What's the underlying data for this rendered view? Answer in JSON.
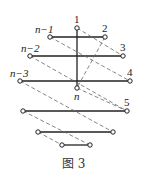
{
  "figure": {
    "caption": "图 3",
    "labels": {
      "top": "1",
      "r1_left": "n−1",
      "r1_right": "2",
      "r2_left": "n−2",
      "r2_right": "3",
      "r3_left": "n−3",
      "r3_right": "4",
      "center_bottom": "n",
      "r4_right": "5"
    },
    "nodes": [
      {
        "id": "1",
        "x": 77,
        "y": 28
      },
      {
        "id": "n-1",
        "x": 50,
        "y": 37
      },
      {
        "id": "2",
        "x": 105,
        "y": 37
      },
      {
        "id": "n-2",
        "x": 30,
        "y": 56
      },
      {
        "id": "3",
        "x": 123,
        "y": 56
      },
      {
        "id": "n-3",
        "x": 20,
        "y": 81
      },
      {
        "id": "4",
        "x": 130,
        "y": 81
      },
      {
        "id": "n",
        "x": 77,
        "y": 88
      },
      {
        "id": "r4-left",
        "x": 23,
        "y": 111
      },
      {
        "id": "5",
        "x": 127,
        "y": 111
      },
      {
        "id": "r5-left",
        "x": 38,
        "y": 132
      },
      {
        "id": "r5-right",
        "x": 113,
        "y": 132
      },
      {
        "id": "r6-left",
        "x": 62,
        "y": 145
      },
      {
        "id": "r6-right",
        "x": 90,
        "y": 145
      }
    ],
    "solid_edges": [
      [
        "1",
        "n"
      ],
      [
        "n-1",
        "2"
      ],
      [
        "n-2",
        "3"
      ],
      [
        "n-3",
        "4"
      ],
      [
        "r4-left",
        "5"
      ],
      [
        "r5-left",
        "r5-right"
      ],
      [
        "r6-left",
        "r6-right"
      ]
    ],
    "dashed_edges": [
      [
        "1",
        "3"
      ],
      [
        "n-1",
        "4"
      ],
      [
        "2",
        "n"
      ],
      [
        "n-2",
        "5"
      ],
      [
        "n",
        "5"
      ],
      [
        "n-3",
        "r5-right"
      ],
      [
        "r4-left",
        "r6-right"
      ],
      [
        "r5-left",
        "r6-left"
      ]
    ]
  }
}
